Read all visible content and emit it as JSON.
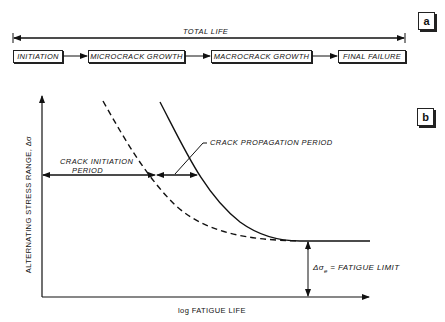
{
  "panel_a": {
    "tag": "a",
    "total_life_label": "TOTAL LIFE",
    "stages": [
      {
        "label": "INITIATION"
      },
      {
        "label": "MICROCRACK GROWTH"
      },
      {
        "label": "MACROCRACK GROWTH"
      },
      {
        "label": "FINAL FAILURE"
      }
    ]
  },
  "panel_b": {
    "tag": "b",
    "y_axis_label": "ALTERNATING STRESS RANGE, Δσ",
    "x_axis_label": "log FATIGUE LIFE",
    "annotations": {
      "crack_initiation": [
        "CRACK INITIATION",
        "PERIOD"
      ],
      "crack_propagation": "CRACK PROPAGATION PERIOD",
      "fatigue_limit_symbol": "Δσ",
      "fatigue_limit_subscript": "e",
      "fatigue_limit_text": " = FATIGUE LIMIT"
    },
    "curves": [
      {
        "name": "crack initiation curve",
        "style": "dashed"
      },
      {
        "name": "total fatigue life (S-N) curve",
        "style": "solid"
      }
    ]
  },
  "colors": {
    "ink": "#111111",
    "background": "#ffffff"
  }
}
